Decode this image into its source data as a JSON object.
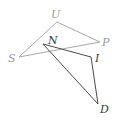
{
  "diagram": {
    "type": "geometry",
    "colors": {
      "light_triangle": "#a8a8a8",
      "dark_triangle": "#4a4a4a"
    },
    "triangles": [
      {
        "name": "SUP",
        "style": "light",
        "vertices": [
          {
            "label": "S",
            "x": 19,
            "y": 57
          },
          {
            "label": "U",
            "x": 57,
            "y": 22
          },
          {
            "label": "P",
            "x": 100,
            "y": 42
          }
        ]
      },
      {
        "name": "NID",
        "style": "dark",
        "vertices": [
          {
            "label": "N",
            "x": 43,
            "y": 44
          },
          {
            "label": "I",
            "x": 91,
            "y": 57
          },
          {
            "label": "D",
            "x": 98,
            "y": 104
          }
        ]
      }
    ],
    "labels": {
      "S": "S",
      "U": "U",
      "P": "P",
      "N": "N",
      "I": "I",
      "D": "D"
    }
  }
}
